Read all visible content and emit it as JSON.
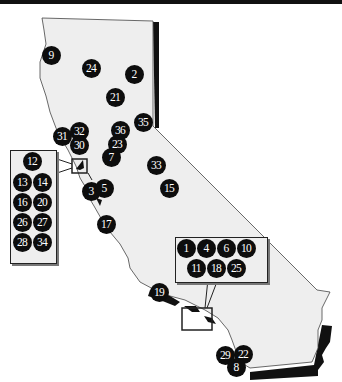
{
  "map": {
    "region": "California",
    "land_color": "#eeeeee",
    "marker_color": "#0d0d0d",
    "marker_text_color": "#ffffff",
    "markers": [
      {
        "id": "9",
        "x": 51,
        "y": 55
      },
      {
        "id": "24",
        "x": 91,
        "y": 68
      },
      {
        "id": "2",
        "x": 134,
        "y": 74
      },
      {
        "id": "21",
        "x": 115,
        "y": 97
      },
      {
        "id": "35",
        "x": 143,
        "y": 122
      },
      {
        "id": "36",
        "x": 120,
        "y": 130
      },
      {
        "id": "31",
        "x": 62,
        "y": 136
      },
      {
        "id": "32",
        "x": 79,
        "y": 131
      },
      {
        "id": "30",
        "x": 79,
        "y": 145
      },
      {
        "id": "23",
        "x": 117,
        "y": 144
      },
      {
        "id": "7",
        "x": 111,
        "y": 157
      },
      {
        "id": "33",
        "x": 156,
        "y": 165
      },
      {
        "id": "15",
        "x": 169,
        "y": 188
      },
      {
        "id": "3",
        "x": 91,
        "y": 191
      },
      {
        "id": "5",
        "x": 104,
        "y": 188
      },
      {
        "id": "17",
        "x": 106,
        "y": 224
      },
      {
        "id": "19",
        "x": 159,
        "y": 292
      },
      {
        "id": "29",
        "x": 225,
        "y": 355
      },
      {
        "id": "22",
        "x": 243,
        "y": 354
      },
      {
        "id": "8",
        "x": 236,
        "y": 367
      }
    ],
    "inset_bay_area": {
      "markers": [
        {
          "id": "12",
          "x": 32,
          "y": 161
        },
        {
          "id": "13",
          "x": 22,
          "y": 182
        },
        {
          "id": "14",
          "x": 42,
          "y": 182
        },
        {
          "id": "16",
          "x": 22,
          "y": 202
        },
        {
          "id": "20",
          "x": 42,
          "y": 202
        },
        {
          "id": "26",
          "x": 22,
          "y": 222
        },
        {
          "id": "27",
          "x": 42,
          "y": 222
        },
        {
          "id": "28",
          "x": 22,
          "y": 242
        },
        {
          "id": "34",
          "x": 42,
          "y": 242
        }
      ]
    },
    "inset_los_angeles": {
      "markers": [
        {
          "id": "1",
          "x": 186,
          "y": 248
        },
        {
          "id": "4",
          "x": 206,
          "y": 248
        },
        {
          "id": "6",
          "x": 226,
          "y": 248
        },
        {
          "id": "10",
          "x": 246,
          "y": 248
        },
        {
          "id": "11",
          "x": 196,
          "y": 268
        },
        {
          "id": "18",
          "x": 216,
          "y": 268
        },
        {
          "id": "25",
          "x": 236,
          "y": 268
        }
      ]
    }
  }
}
